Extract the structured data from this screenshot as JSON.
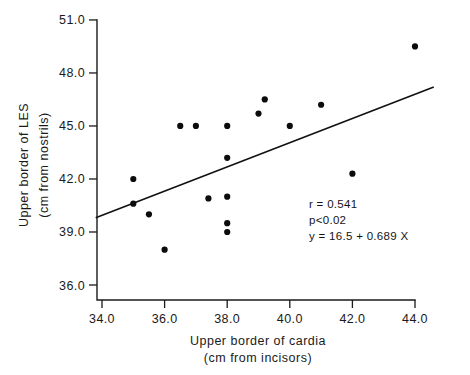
{
  "figure": {
    "background": "#ffffff",
    "ink_color": "#111111",
    "point_color": "#0c0c0c"
  },
  "annotations": {
    "correlation": "r = 0.541",
    "pvalue": "p<0.02",
    "equation": "y = 16.5 + 0.689 X"
  },
  "caption": {
    "text": ""
  },
  "chart_data": {
    "type": "scatter",
    "title": "",
    "xlabel": "Upper border of cardia",
    "xlabel_units": "(cm from incisors)",
    "ylabel": "Upper border of LES",
    "ylabel_units": "(cm from nostrils)",
    "xlim": [
      33.5,
      44.6
    ],
    "ylim": [
      35.2,
      51.6
    ],
    "xticks": [
      34.0,
      36.0,
      38.0,
      40.0,
      42.0,
      44.0
    ],
    "xtick_labels": [
      "34.0",
      "36.0",
      "38.0",
      "40.0",
      "42.0",
      "44.0"
    ],
    "yticks": [
      36.0,
      39.0,
      42.0,
      45.0,
      48.0,
      51.0
    ],
    "ytick_labels": [
      "36.0",
      "39.0",
      "42.0",
      "45.0",
      "48.0",
      "51.0"
    ],
    "grid": false,
    "legend": false,
    "x": [
      35.0,
      35.0,
      35.5,
      36.0,
      36.5,
      37.0,
      37.4,
      38.0,
      38.0,
      38.0,
      38.0,
      38.0,
      39.0,
      39.2,
      40.0,
      41.0,
      42.0,
      44.0
    ],
    "y": [
      42.0,
      40.6,
      40.0,
      38.0,
      45.0,
      45.0,
      40.9,
      45.0,
      43.2,
      41.0,
      39.5,
      39.0,
      45.7,
      46.5,
      45.0,
      46.2,
      42.3,
      49.5
    ],
    "points": [
      {
        "x": 35.0,
        "y": 42.0
      },
      {
        "x": 35.0,
        "y": 40.6
      },
      {
        "x": 35.5,
        "y": 40.0
      },
      {
        "x": 36.0,
        "y": 38.0
      },
      {
        "x": 36.5,
        "y": 45.0
      },
      {
        "x": 37.0,
        "y": 45.0
      },
      {
        "x": 37.4,
        "y": 40.9
      },
      {
        "x": 38.0,
        "y": 45.0
      },
      {
        "x": 38.0,
        "y": 43.2
      },
      {
        "x": 38.0,
        "y": 41.0
      },
      {
        "x": 38.0,
        "y": 39.5
      },
      {
        "x": 38.0,
        "y": 39.0
      },
      {
        "x": 39.0,
        "y": 45.7
      },
      {
        "x": 39.2,
        "y": 46.5
      },
      {
        "x": 40.0,
        "y": 45.0
      },
      {
        "x": 41.0,
        "y": 46.2
      },
      {
        "x": 42.0,
        "y": 42.3
      },
      {
        "x": 44.0,
        "y": 49.5
      }
    ],
    "fit_line": {
      "intercept": 16.5,
      "slope": 0.689,
      "x_start": 33.8,
      "y_start": 39.8,
      "x_end": 44.6,
      "y_end": 47.2
    },
    "stats": {
      "r": 0.541,
      "p": "<0.02",
      "equation": "y = 16.5 + 0.689 X"
    }
  }
}
